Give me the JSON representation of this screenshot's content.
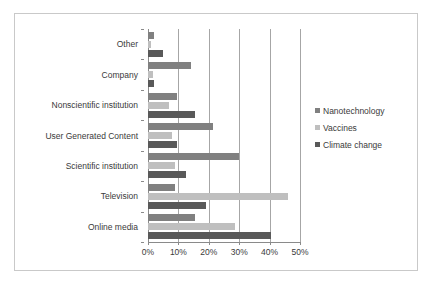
{
  "chart_data": {
    "type": "bar",
    "orientation": "horizontal",
    "title": "",
    "subtitle": "",
    "xlabel": "",
    "ylabel": "",
    "xlim": [
      0,
      50
    ],
    "xtick_labels": [
      "0%",
      "10%",
      "20%",
      "30%",
      "40%",
      "50%"
    ],
    "xtick_values": [
      0,
      10,
      20,
      30,
      40,
      50
    ],
    "grid": "vertical",
    "legend_position": "right",
    "categories": [
      "Other",
      "Company",
      "Nonscientific institution",
      "User Generated Content",
      "Scientific institution",
      "Television",
      "Online media"
    ],
    "series": [
      {
        "name": "Nanotechnology",
        "color": "#808080",
        "values": [
          2,
          14,
          9.5,
          21.5,
          30,
          9,
          15.5
        ]
      },
      {
        "name": "Vaccines",
        "color": "#bfbfbf",
        "values": [
          1,
          1.5,
          7,
          8,
          8.8,
          46,
          28.5
        ]
      },
      {
        "name": "Climate change",
        "color": "#595959",
        "values": [
          5,
          2,
          15.5,
          9.5,
          12.5,
          19,
          40.5
        ]
      }
    ]
  },
  "legend": {
    "items": [
      {
        "label": "Nanotechnology",
        "color": "#808080"
      },
      {
        "label": "Vaccines",
        "color": "#bfbfbf"
      },
      {
        "label": "Climate change",
        "color": "#595959"
      }
    ]
  },
  "colors": {
    "nanotechnology": "#808080",
    "vaccines": "#bfbfbf",
    "climate_change": "#595959",
    "gridline": "#a6a6a6",
    "axis": "#8a8a8a",
    "frame_border": "#c9c9c9",
    "background": "#ffffff",
    "text": "#3a3a3a"
  }
}
